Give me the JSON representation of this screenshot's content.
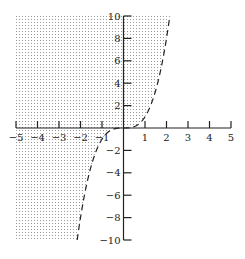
{
  "chart_data": {
    "type": "line",
    "title": "",
    "series": [
      {
        "name": "y = x^3",
        "style": "dashed",
        "function": "x^3",
        "x": [
          -2.15,
          -2,
          -1.5,
          -1,
          -0.5,
          0,
          0.5,
          1,
          1.5,
          2,
          2.15
        ],
        "y": [
          -10,
          -8,
          -3.375,
          -1,
          -0.125,
          0,
          0.125,
          1,
          3.375,
          8,
          10
        ]
      }
    ],
    "shaded_region": "y > x^3",
    "xlim": [
      -5,
      5
    ],
    "ylim": [
      -10,
      10
    ],
    "x_ticks": [
      -5,
      -4,
      -3,
      -2,
      -1,
      1,
      2,
      3,
      4,
      5
    ],
    "y_ticks": [
      -10,
      -8,
      -6,
      -4,
      -2,
      2,
      4,
      6,
      8,
      10
    ],
    "x_tick_labels": [
      "−5",
      "−4",
      "−3",
      "−2",
      "−1",
      "1",
      "2",
      "3",
      "4",
      "5"
    ],
    "y_tick_labels": [
      "−10",
      "−8",
      "−6",
      "−4",
      "−2",
      "2",
      "4",
      "6",
      "8",
      "10"
    ],
    "xlabel": "",
    "ylabel": "",
    "grid": false,
    "colors": {
      "shade_dot": "#9a9a9a",
      "axis": "#222222",
      "curve": "#222222"
    }
  }
}
